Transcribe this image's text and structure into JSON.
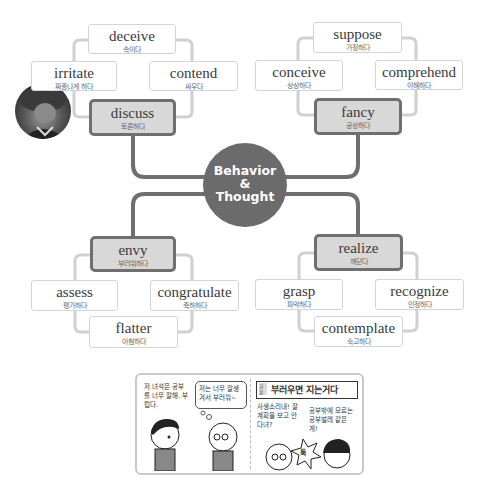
{
  "hub": {
    "line1": "Behavior",
    "line2": "&",
    "line3": "Thought",
    "color": "#6b6b6b"
  },
  "clusters": {
    "discuss": {
      "main": {
        "en": "discuss",
        "ko": "토론하다"
      },
      "children": [
        {
          "en": "deceive",
          "ko": "속이다"
        },
        {
          "en": "irritate",
          "ko": "짜증나게 하다"
        },
        {
          "en": "contend",
          "ko": "싸우다"
        }
      ]
    },
    "fancy": {
      "main": {
        "en": "fancy",
        "ko": "공상하다"
      },
      "children": [
        {
          "en": "suppose",
          "ko": "가정하다"
        },
        {
          "en": "conceive",
          "ko": "상상하다"
        },
        {
          "en": "comprehend",
          "ko": "이해하다"
        }
      ]
    },
    "envy": {
      "main": {
        "en": "envy",
        "ko": "부러워하다"
      },
      "children": [
        {
          "en": "assess",
          "ko": "평가하다"
        },
        {
          "en": "congratulate",
          "ko": "축하하다"
        },
        {
          "en": "flatter",
          "ko": "아첨하다"
        }
      ]
    },
    "realize": {
      "main": {
        "en": "realize",
        "ko": "깨닫다"
      },
      "children": [
        {
          "en": "grasp",
          "ko": "파악하다"
        },
        {
          "en": "recognize",
          "ko": "인정하다"
        },
        {
          "en": "contemplate",
          "ko": "숙고하다"
        }
      ]
    }
  },
  "comic": {
    "panel1": {
      "narration": "저 녀석은 공부를 너무 잘해. 부럽다.",
      "thought": "저는 너무 잘생겨서 부러워~"
    },
    "panel2": {
      "title_tag": "교훈",
      "title": "부러우면 지는거다",
      "speech_left": "사생소리내! 잘 계획을 보고 안 다녀?",
      "speech_right": "공부밖에 모르는 공부벌레 같은 게!",
      "sfx": "툭"
    }
  }
}
